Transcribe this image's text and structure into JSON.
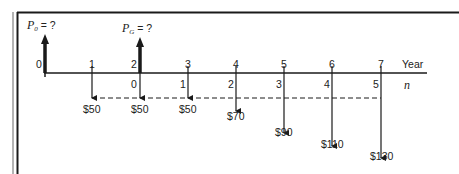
{
  "diagram": {
    "title_labels": {
      "p0": {
        "symbol": "P",
        "subscript": "0",
        "rest": " = ?"
      },
      "pg": {
        "symbol": "P",
        "subscript": "G",
        "rest": " = ?"
      }
    },
    "axis": {
      "year_label": "Year",
      "n_label": "n",
      "year_ticks": [
        "0",
        "1",
        "2",
        "3",
        "4",
        "5",
        "6",
        "7"
      ],
      "n_ticks": [
        "0",
        "1",
        "2",
        "3",
        "4",
        "5"
      ]
    },
    "cash_flows": [
      {
        "year": "1",
        "amount": "$50"
      },
      {
        "year": "2",
        "amount": "$50"
      },
      {
        "year": "3",
        "amount": "$50"
      },
      {
        "year": "4",
        "amount": "$70"
      },
      {
        "year": "5",
        "amount": "$90"
      },
      {
        "year": "6",
        "amount": "$110"
      },
      {
        "year": "7",
        "amount": "$130"
      }
    ],
    "colors": {
      "line": "#1a1a1a",
      "frame_outer": "#9a9a9a"
    }
  }
}
